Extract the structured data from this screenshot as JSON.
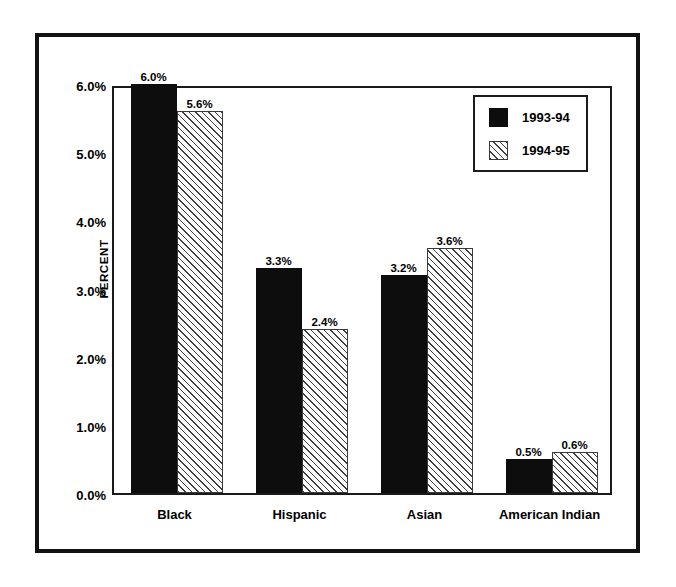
{
  "chart_data": {
    "type": "bar",
    "title": "",
    "xlabel": "",
    "ylabel": "PERCENT",
    "ylim": [
      0,
      6
    ],
    "grid": false,
    "legend_position": "top-right",
    "categories": [
      "Black",
      "Hispanic",
      "Asian",
      "American Indian"
    ],
    "ytick_labels": [
      "0.0%",
      "1.0%",
      "2.0%",
      "3.0%",
      "4.0%",
      "5.0%",
      "6.0%"
    ],
    "ytick_values": [
      0,
      1,
      2,
      3,
      4,
      5,
      6
    ],
    "series": [
      {
        "name": "1993-94",
        "style": "solid-black",
        "values": [
          6.0,
          3.3,
          3.2,
          0.5
        ],
        "labels": [
          "6.0%",
          "3.3%",
          "3.2%",
          "0.5%"
        ]
      },
      {
        "name": "1994-95",
        "style": "diagonal-hatch",
        "values": [
          5.6,
          2.4,
          3.6,
          0.6
        ],
        "labels": [
          "5.6%",
          "2.4%",
          "3.6%",
          "0.6%"
        ]
      }
    ]
  },
  "legend": {
    "entries": [
      {
        "label": "1993-94",
        "style": "solid-black"
      },
      {
        "label": "1994-95",
        "style": "diagonal-hatch"
      }
    ]
  },
  "colors": {
    "series_1993_94": "#0d0d0d",
    "series_1994_95_fill": "#fdfdfd",
    "series_1994_95_hatch": "#3f3f3f",
    "frame": "#121212",
    "axis": "#1a1a1a",
    "background": "#ffffff",
    "text": "#000000"
  }
}
